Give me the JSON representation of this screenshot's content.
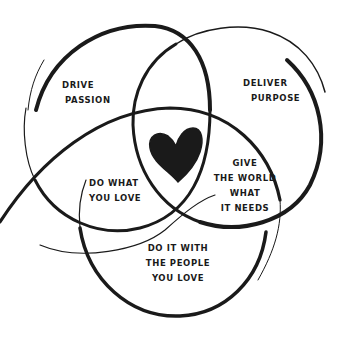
{
  "diagram": {
    "type": "venn",
    "circles": [
      {
        "name": "drive-passion",
        "label_lines": [
          "DRIVE",
          "PASSION"
        ]
      },
      {
        "name": "deliver-purpose",
        "label_lines": [
          "DELIVER",
          "PURPOSE"
        ]
      },
      {
        "name": "people-you-love",
        "label_lines": [
          "DO IT WITH",
          "THE PEOPLE",
          "YOU LOVE"
        ]
      }
    ],
    "intersections": {
      "passion_people": [
        "DO WHAT",
        "YOU LOVE"
      ],
      "purpose_people": [
        "GIVE",
        "THE WORLD",
        "WHAT",
        "IT NEEDS"
      ],
      "center": "heart-icon"
    },
    "colors": {
      "ink": "#1a1a1a",
      "background": "#ffffff"
    }
  }
}
